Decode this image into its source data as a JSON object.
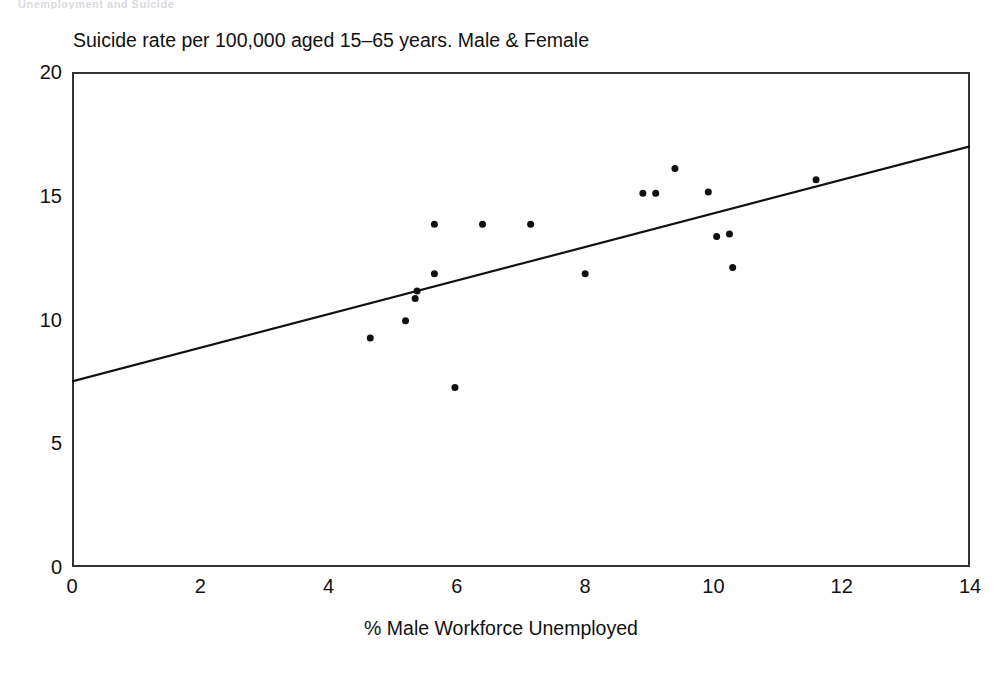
{
  "scan": {
    "header_fragment": "Unemployment and Suicide"
  },
  "chart_data": {
    "type": "scatter",
    "title": "Suicide rate per 100,000 aged 15–65 years. Male & Female",
    "subtitle": "",
    "xlabel": "% Male Workforce Unemployed",
    "ylabel": "",
    "xlim": [
      0,
      14
    ],
    "ylim": [
      0,
      20
    ],
    "xticks": [
      0,
      2,
      4,
      6,
      8,
      10,
      12,
      14
    ],
    "yticks": [
      0,
      5,
      10,
      15,
      20
    ],
    "xtick_labels": [
      "0",
      "2",
      "4",
      "6",
      "8",
      "10",
      "12",
      "14"
    ],
    "ytick_labels": [
      "0",
      "5",
      "10",
      "15",
      "20"
    ],
    "grid": false,
    "legend": false,
    "legend_position": "none",
    "marker": {
      "shape": "circle",
      "color": "#111111",
      "size_px": 7
    },
    "points": [
      {
        "x": 4.65,
        "y": 9.25
      },
      {
        "x": 5.2,
        "y": 9.95
      },
      {
        "x": 5.35,
        "y": 10.85
      },
      {
        "x": 5.38,
        "y": 11.15
      },
      {
        "x": 5.65,
        "y": 11.85
      },
      {
        "x": 5.65,
        "y": 13.85
      },
      {
        "x": 5.97,
        "y": 7.25
      },
      {
        "x": 6.4,
        "y": 13.85
      },
      {
        "x": 7.15,
        "y": 13.85
      },
      {
        "x": 8.0,
        "y": 11.85
      },
      {
        "x": 8.9,
        "y": 15.1
      },
      {
        "x": 9.1,
        "y": 15.1
      },
      {
        "x": 9.4,
        "y": 16.1
      },
      {
        "x": 9.92,
        "y": 15.15
      },
      {
        "x": 10.05,
        "y": 13.35
      },
      {
        "x": 10.25,
        "y": 13.45
      },
      {
        "x": 10.3,
        "y": 12.1
      },
      {
        "x": 11.6,
        "y": 15.65
      }
    ],
    "trendline": {
      "type": "linear",
      "color": "#111111",
      "width_px": 2.2,
      "x0": 0.0,
      "y0": 7.5,
      "x1": 14.0,
      "y1": 17.0
    },
    "frame": {
      "color": "#333333",
      "width_px": 2,
      "sides": [
        "left",
        "right",
        "top",
        "bottom"
      ]
    }
  }
}
